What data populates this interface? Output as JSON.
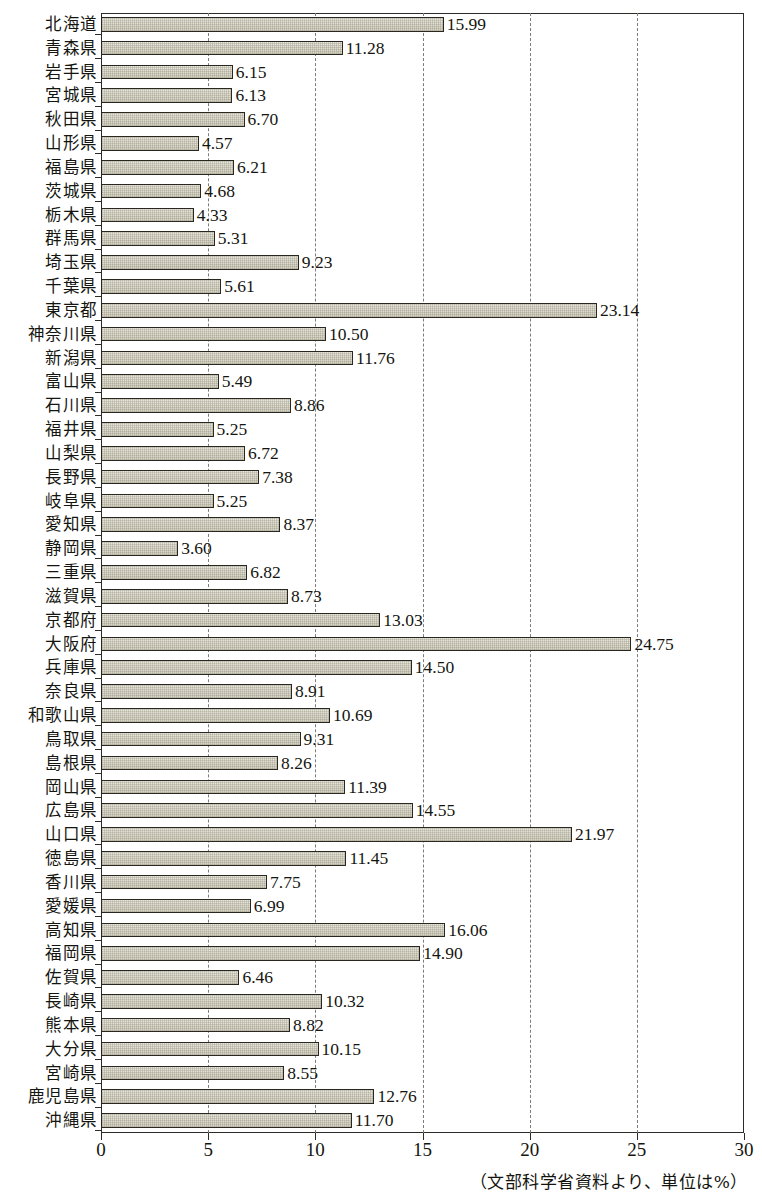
{
  "chart_data": {
    "type": "bar",
    "orientation": "horizontal",
    "title": "",
    "xlabel": "",
    "ylabel": "",
    "xlim": [
      0,
      30
    ],
    "xticks": [
      0,
      5,
      10,
      15,
      20,
      25,
      30
    ],
    "xtick_labels": [
      "0",
      "5",
      "10",
      "15",
      "20",
      "25",
      "30"
    ],
    "grid": "vertical-dashed",
    "legend": "none",
    "units": "%",
    "source_note": "（文部科学省資料より、単位は%）",
    "categories": [
      "北海道",
      "青森県",
      "岩手県",
      "宮城県",
      "秋田県",
      "山形県",
      "福島県",
      "茨城県",
      "栃木県",
      "群馬県",
      "埼玉県",
      "千葉県",
      "東京都",
      "神奈川県",
      "新潟県",
      "富山県",
      "石川県",
      "福井県",
      "山梨県",
      "長野県",
      "岐阜県",
      "愛知県",
      "静岡県",
      "三重県",
      "滋賀県",
      "京都府",
      "大阪府",
      "兵庫県",
      "奈良県",
      "和歌山県",
      "鳥取県",
      "島根県",
      "岡山県",
      "広島県",
      "山口県",
      "徳島県",
      "香川県",
      "愛媛県",
      "高知県",
      "福岡県",
      "佐賀県",
      "長崎県",
      "熊本県",
      "大分県",
      "宮崎県",
      "鹿児島県",
      "沖縄県"
    ],
    "values": [
      15.99,
      11.28,
      6.15,
      6.13,
      6.7,
      4.57,
      6.21,
      4.68,
      4.33,
      5.31,
      9.23,
      5.61,
      23.14,
      10.5,
      11.76,
      5.49,
      8.86,
      5.25,
      6.72,
      7.38,
      5.25,
      8.37,
      3.6,
      6.82,
      8.73,
      13.03,
      24.75,
      14.5,
      8.91,
      10.69,
      9.31,
      8.26,
      11.39,
      14.55,
      21.97,
      11.45,
      7.75,
      6.99,
      16.06,
      14.9,
      6.46,
      10.32,
      8.82,
      10.15,
      8.55,
      12.76,
      11.7
    ],
    "value_labels": [
      "15.99",
      "11.28",
      "6.15",
      "6.13",
      "6.70",
      "4.57",
      "6.21",
      "4.68",
      "4.33",
      "5.31",
      "9.23",
      "5.61",
      "23.14",
      "10.50",
      "11.76",
      "5.49",
      "8.86",
      "5.25",
      "6.72",
      "7.38",
      "5.25",
      "8.37",
      "3.60",
      "6.82",
      "8.73",
      "13.03",
      "24.75",
      "14.50",
      "8.91",
      "10.69",
      "9.31",
      "8.26",
      "11.39",
      "14.55",
      "21.97",
      "11.45",
      "7.75",
      "6.99",
      "16.06",
      "14.90",
      "6.46",
      "10.32",
      "8.82",
      "10.15",
      "8.55",
      "12.76",
      "11.70"
    ],
    "colors": {
      "bar_fill": "#ded ccb",
      "bar_fill_hex": "#dedcce",
      "bar_border": "#29271f",
      "axis": "#2b2b28",
      "gridline": "#7d7d78",
      "text": "#15150f",
      "background": "#ffffff"
    }
  }
}
